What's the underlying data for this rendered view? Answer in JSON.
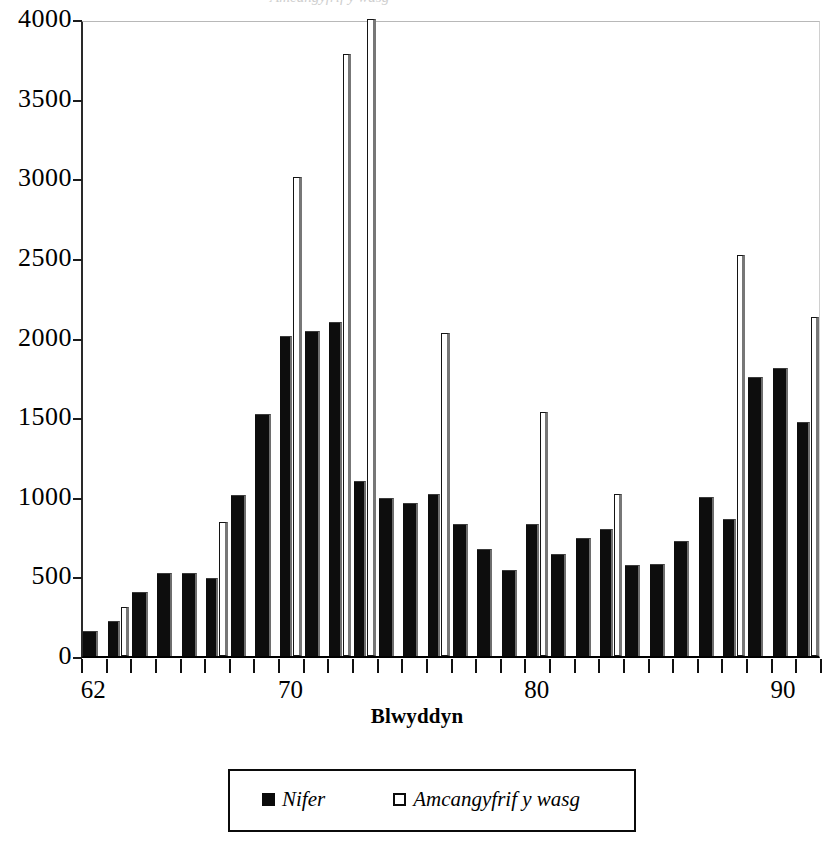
{
  "top_clipped_text": "Amcangyfrif y wasg",
  "axes": {
    "y": {
      "ticks": [
        0,
        500,
        1000,
        1500,
        2000,
        2500,
        3000,
        3500,
        4000
      ],
      "min": 0,
      "max": 4000,
      "label": ""
    },
    "x": {
      "title": "Blwyddyn",
      "tick_labels": [
        "62",
        "70",
        "80",
        "90"
      ],
      "tick_years": [
        62,
        70,
        80,
        90
      ],
      "min": 62,
      "max": 91
    }
  },
  "legend": {
    "position": "below-axis",
    "entries": [
      {
        "label": "Nifer",
        "swatch": "filled",
        "color": "#0b0b0b"
      },
      {
        "label": "Amcangyfrif y wasg",
        "swatch": "open",
        "color": "#ffffff"
      }
    ]
  },
  "colors": {
    "nifer": "#0d0d0d",
    "amcangyfrif": "#ffffff",
    "outline": "#0b0b0b",
    "shadow": "#6e6e6e",
    "background": "#ffffff"
  },
  "chart_data": {
    "type": "bar",
    "title": "",
    "xlabel": "Blwyddyn",
    "ylabel": "",
    "ylim": [
      0,
      4000
    ],
    "grid": false,
    "legend_position": "bottom",
    "categories": [
      "62",
      "63",
      "64",
      "65",
      "66",
      "67",
      "68",
      "69",
      "70",
      "71",
      "72",
      "73",
      "74",
      "75",
      "76",
      "77",
      "78",
      "79",
      "80",
      "81",
      "82",
      "83",
      "84",
      "85",
      "86",
      "87",
      "88",
      "89",
      "90",
      "91"
    ],
    "series": [
      {
        "name": "Nifer",
        "values": [
          160,
          220,
          400,
          520,
          520,
          490,
          1010,
          1520,
          2010,
          2040,
          2100,
          1100,
          990,
          960,
          1020,
          830,
          670,
          540,
          830,
          640,
          740,
          800,
          570,
          580,
          720,
          1000,
          860,
          1750,
          1810,
          1470
        ]
      },
      {
        "name": "Amcangyfrif y wasg",
        "values": [
          null,
          310,
          null,
          null,
          null,
          840,
          null,
          null,
          3010,
          null,
          3780,
          4000,
          null,
          null,
          2030,
          null,
          null,
          null,
          1530,
          null,
          null,
          1020,
          null,
          null,
          null,
          null,
          2520,
          null,
          null,
          2130
        ]
      }
    ]
  }
}
